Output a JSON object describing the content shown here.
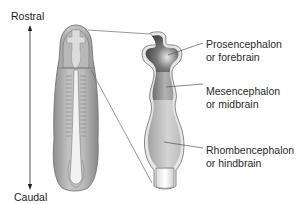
{
  "figure": {
    "axis": {
      "top_label": "Rostral",
      "bottom_label": "Caudal"
    },
    "labels": [
      {
        "line1": "Prosencephalon",
        "line2": "or forebrain"
      },
      {
        "line1": "Mesencephalon",
        "line2": "or midbrain"
      },
      {
        "line1": "Rhombencephalon",
        "line2": "or hindbrain"
      }
    ],
    "colors": {
      "embryo_fill": "#a8a8a8",
      "forebrain_fill": "#555555",
      "midbrain_fill": "#8a8a8a",
      "hindbrain_fill": "#b5b5b5",
      "line": "#555555"
    }
  }
}
